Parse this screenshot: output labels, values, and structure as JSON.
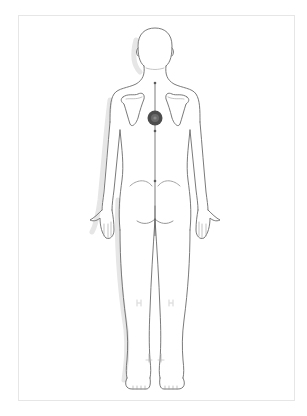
{
  "diagram": {
    "type": "body-chart",
    "view": "posterior",
    "colors": {
      "outline": "#6b6b6b",
      "shadow": "#e4e4e4",
      "marker": "#555555",
      "marker_highlight": "#8a8a8a",
      "frame_border": "#e6e6e6",
      "background": "#ffffff"
    },
    "markers": [
      {
        "name": "pain-point-mid-back",
        "cx": 155,
        "cy": 118,
        "r": 7
      }
    ],
    "spine_points": [
      {
        "cx": 155,
        "cy": 83
      },
      {
        "cx": 155,
        "cy": 131
      },
      {
        "cx": 155,
        "cy": 181
      }
    ]
  }
}
